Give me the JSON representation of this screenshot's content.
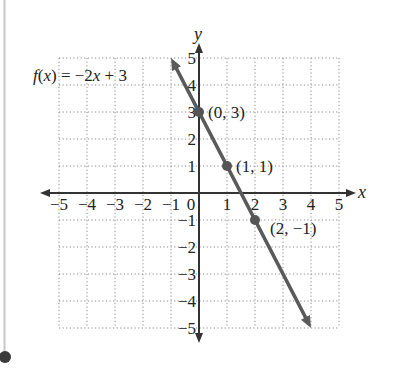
{
  "chart_data": {
    "type": "line",
    "title": "",
    "function_label": "f(x) = −2x + 3",
    "function_label_parts": {
      "f": "f",
      "open": "(",
      "x": "x",
      "close": ")",
      "rest": " = −2",
      "x2": "x",
      "tail": " + 3"
    },
    "xlabel": "x",
    "ylabel": "y",
    "xlim": [
      -5,
      5
    ],
    "ylim": [
      -5,
      5
    ],
    "grid": true,
    "grid_style": "dotted",
    "x_ticks": [
      "−5",
      "−4",
      "−3",
      "−2",
      "−1",
      "0",
      "1",
      "2",
      "3",
      "4",
      "5"
    ],
    "y_ticks": [
      "5",
      "4",
      "3",
      "2",
      "1",
      "−1",
      "−2",
      "−3",
      "−4",
      "−5"
    ],
    "series": [
      {
        "name": "f(x) = −2x + 3",
        "slope": -2,
        "intercept": 3,
        "x": [
          -1,
          4
        ],
        "y": [
          5,
          -5
        ],
        "color": "#555555",
        "arrows": "both"
      }
    ],
    "points": [
      {
        "x": 0,
        "y": 3,
        "label": "(0, 3)"
      },
      {
        "x": 1,
        "y": 1,
        "label": "(1, 1)"
      },
      {
        "x": 2,
        "y": -1,
        "label": "(2, −1)"
      }
    ]
  },
  "colors": {
    "line": "#5a5a5a",
    "axis": "#333333",
    "grid": "#8a8a8a",
    "margin_bar": "#c8c8c8",
    "margin_dot": "#3a3a3a"
  }
}
